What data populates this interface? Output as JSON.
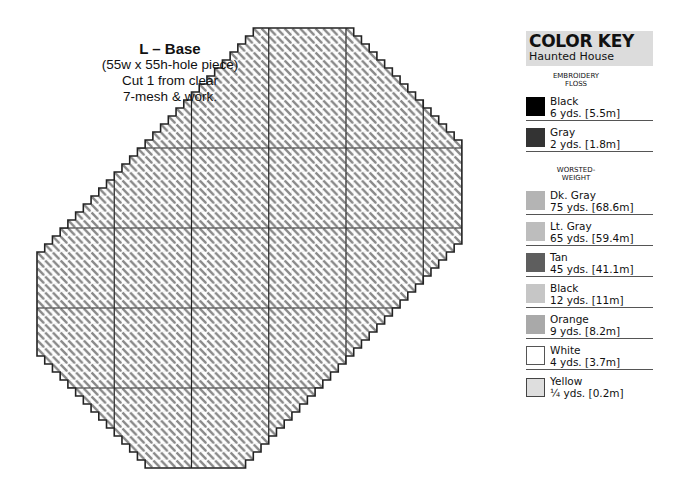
{
  "piece": {
    "title": "L – Base",
    "lines": [
      "(55w x 55h-hole piece)",
      "Cut 1 from clear",
      "7-mesh & work."
    ]
  },
  "grid": {
    "cols": 55,
    "rows": 55,
    "origin_x": 37,
    "origin_y": 28,
    "cell_w": 7.725,
    "cell_h": 8.0,
    "major_every": 10,
    "outline_color": "#222222",
    "stitch_color": "#8a8a8a",
    "shape_vertices_cells": [
      [
        29,
        0
      ],
      [
        40,
        0
      ],
      [
        55,
        15
      ],
      [
        55,
        26
      ],
      [
        26,
        55
      ],
      [
        15,
        55
      ],
      [
        0,
        40
      ],
      [
        0,
        29
      ]
    ]
  },
  "color_key": {
    "title": "COLOR KEY",
    "subtitle": "Haunted House",
    "groups": [
      {
        "label_lines": [
          "EMBROIDERY",
          "FLOSS"
        ],
        "items": [
          {
            "name": "Black",
            "amount": "6 yds. [5.5m]",
            "color": "#000000",
            "border": "#000000"
          },
          {
            "name": "Gray",
            "amount": "2 yds. [1.8m]",
            "color": "#333333",
            "border": "#333333"
          }
        ]
      },
      {
        "label_lines": [
          "WORSTED-",
          "WEIGHT"
        ],
        "items": [
          {
            "name": "Dk. Gray",
            "amount": "75 yds. [68.6m]",
            "color": "#b4b4b4",
            "border": "#b4b4b4"
          },
          {
            "name": "Lt. Gray",
            "amount": "65 yds. [59.4m]",
            "color": "#bdbdbd",
            "border": "#bdbdbd"
          },
          {
            "name": "Tan",
            "amount": "45 yds. [41.1m]",
            "color": "#5e5e5e",
            "border": "#5e5e5e"
          },
          {
            "name": "Black",
            "amount": "12 yds. [11m]",
            "color": "#c6c6c6",
            "border": "#c6c6c6"
          },
          {
            "name": "Orange",
            "amount": "9 yds. [8.2m]",
            "color": "#a9a9a9",
            "border": "#a9a9a9"
          },
          {
            "name": "White",
            "amount": "4 yds. [3.7m]",
            "color": "#ffffff",
            "border": "#555555"
          },
          {
            "name": "Yellow",
            "amount": "¼ yds. [0.2m]",
            "color": "#dedede",
            "border": "#444444"
          }
        ]
      }
    ]
  }
}
